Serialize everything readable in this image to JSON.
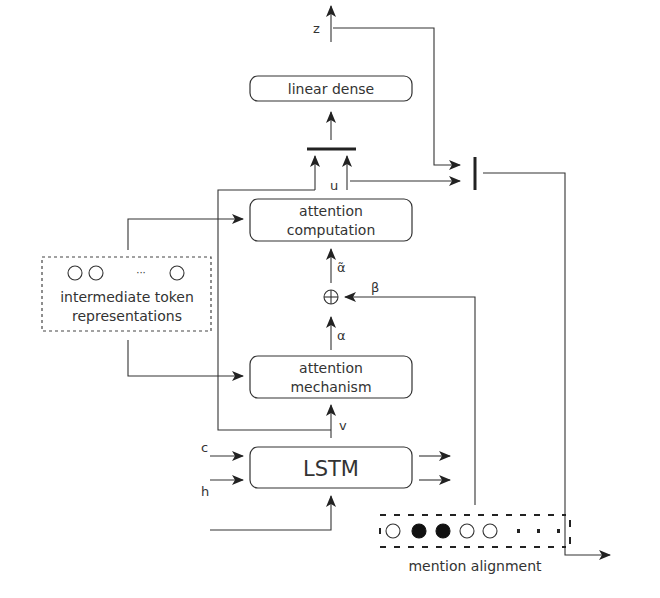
{
  "diagram": {
    "nodes": {
      "linear_dense": "linear dense",
      "attention_computation_line1": "attention",
      "attention_computation_line2": "computation",
      "attention_mechanism_line1": "attention",
      "attention_mechanism_line2": "mechanism",
      "lstm": "LSTM",
      "intermediate_line1": "intermediate token",
      "intermediate_line2": "representations",
      "intermediate_ellipsis": "···",
      "mention_alignment": "mention alignment",
      "sum_symbol": "⊕"
    },
    "labels": {
      "z": "z",
      "u": "u",
      "alpha_tilde": "α̃",
      "alpha": "α",
      "beta": "β",
      "v": "v",
      "c": "c",
      "h": "h"
    },
    "mention_alignment_cells": [
      "empty",
      "filled",
      "filled",
      "empty",
      "empty",
      "dot",
      "dot",
      "dot"
    ],
    "colors": {
      "stroke": "#333333",
      "background": "#ffffff",
      "filled_cell": "#111111"
    }
  }
}
